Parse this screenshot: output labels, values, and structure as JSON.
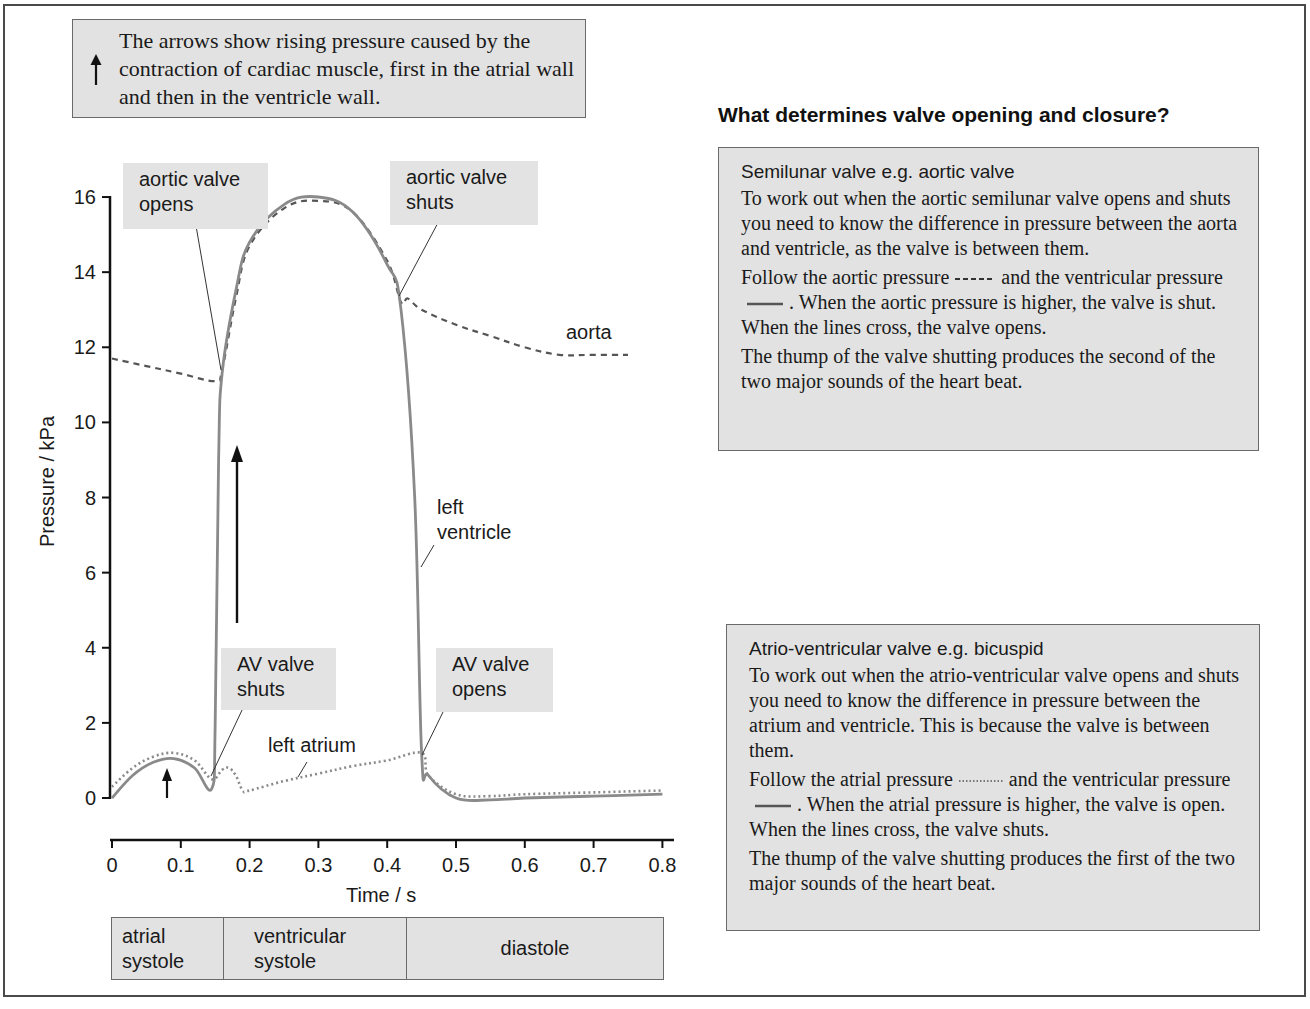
{
  "note": {
    "icon": "up-arrow-icon",
    "text": "The arrows show rising pressure caused by the contraction of cardiac muscle, first in the atrial wall and then in the ventricle wall."
  },
  "chart_data": {
    "type": "line",
    "title": "",
    "xlabel": "Time / s",
    "ylabel": "Pressure / kPa",
    "xlim": [
      0,
      0.8
    ],
    "ylim": [
      0,
      16
    ],
    "xticks": [
      "0",
      "0.1",
      "0.2",
      "0.3",
      "0.4",
      "0.5",
      "0.6",
      "0.7",
      "0.8"
    ],
    "yticks": [
      "0",
      "2",
      "4",
      "6",
      "8",
      "10",
      "12",
      "14",
      "16"
    ],
    "grid": false,
    "series": [
      {
        "name": "aorta",
        "style": "dashed",
        "color": "#555555",
        "x": [
          0.0,
          0.05,
          0.1,
          0.15,
          0.16,
          0.18,
          0.2,
          0.25,
          0.3,
          0.35,
          0.4,
          0.42,
          0.43,
          0.45,
          0.5,
          0.55,
          0.6,
          0.65,
          0.7,
          0.75
        ],
        "y": [
          11.7,
          11.5,
          11.3,
          11.1,
          11.4,
          13.3,
          14.7,
          15.7,
          15.9,
          15.6,
          14.3,
          13.2,
          13.3,
          13.0,
          12.6,
          12.3,
          12.0,
          11.8,
          11.8,
          11.8
        ]
      },
      {
        "name": "left ventricle",
        "style": "solid",
        "color": "#8a8a8a",
        "x": [
          0.0,
          0.03,
          0.06,
          0.09,
          0.12,
          0.145,
          0.15,
          0.155,
          0.16,
          0.18,
          0.2,
          0.25,
          0.3,
          0.35,
          0.4,
          0.42,
          0.44,
          0.45,
          0.46,
          0.5,
          0.55,
          0.6,
          0.7,
          0.8
        ],
        "y": [
          0.0,
          0.6,
          0.95,
          1.05,
          0.8,
          0.25,
          2.0,
          9.0,
          11.3,
          13.5,
          14.8,
          15.8,
          16.0,
          15.6,
          14.2,
          13.0,
          8.0,
          1.2,
          0.6,
          0.0,
          -0.05,
          0.0,
          0.05,
          0.1
        ]
      },
      {
        "name": "left atrium",
        "style": "dotted",
        "color": "#8a8a8a",
        "x": [
          0.0,
          0.03,
          0.06,
          0.09,
          0.12,
          0.145,
          0.16,
          0.17,
          0.18,
          0.19,
          0.2,
          0.25,
          0.3,
          0.35,
          0.4,
          0.45,
          0.46,
          0.5,
          0.55,
          0.6,
          0.7,
          0.8
        ],
        "y": [
          0.3,
          0.8,
          1.1,
          1.2,
          1.0,
          0.5,
          0.75,
          0.8,
          0.6,
          0.2,
          0.2,
          0.45,
          0.65,
          0.85,
          1.0,
          1.2,
          0.6,
          0.1,
          0.05,
          0.1,
          0.15,
          0.2
        ]
      }
    ],
    "annotations": [
      {
        "text": "aortic valve opens",
        "x": 0.155,
        "y": 11.2
      },
      {
        "text": "aortic valve shuts",
        "x": 0.42,
        "y": 13.2
      },
      {
        "text": "AV valve shuts",
        "x": 0.145,
        "y": 0.4
      },
      {
        "text": "AV valve opens",
        "x": 0.45,
        "y": 1.2
      },
      {
        "text": "aorta",
        "x": 0.66,
        "y": 12.4
      },
      {
        "text": "left ventricle",
        "x": 0.46,
        "y": 7.0
      },
      {
        "text": "left atrium",
        "x": 0.25,
        "y": 1.4
      }
    ],
    "arrows": [
      {
        "x": 0.08,
        "y_from": 0.0,
        "y_to": 0.8,
        "meaning": "atrial contraction"
      },
      {
        "x": 0.18,
        "y_from": 4.7,
        "y_to": 9.4,
        "meaning": "ventricular contraction"
      }
    ],
    "phases": [
      {
        "label": "atrial systole",
        "from": 0.0,
        "to": 0.16
      },
      {
        "label": "ventricular systole",
        "from": 0.16,
        "to": 0.43
      },
      {
        "label": "diastole",
        "from": 0.43,
        "to": 0.8
      }
    ]
  },
  "chart_labels": {
    "ylabel": "Pressure / kPa",
    "xlabel": "Time / s",
    "aortic_opens": "aortic valve opens",
    "aortic_opens_l1": "aortic valve",
    "aortic_opens_l2": "opens",
    "aortic_shuts_l1": "aortic valve",
    "aortic_shuts_l2": "shuts",
    "av_shuts_l1": "AV valve",
    "av_shuts_l2": "shuts",
    "av_opens_l1": "AV valve",
    "av_opens_l2": "opens",
    "aorta": "aorta",
    "ventricle_l1": "left",
    "ventricle_l2": "ventricle",
    "atrium": "left atrium"
  },
  "phases": {
    "p1_l1": "atrial",
    "p1_l2": "systole",
    "p2_l1": "ventricular",
    "p2_l2": "systole",
    "p3": "diastole"
  },
  "right_panel": {
    "heading": "What determines valve opening and closure?",
    "semilunar": {
      "title": "Semilunar valve e.g. aortic valve",
      "para1": "To work out when the aortic semilunar valve opens and shuts you need to know the difference in pressure between the aorta and ventricle, as the valve is between them.",
      "para2_a": "Follow the aortic pressure",
      "para2_b": "and the ventricular pressure",
      "para2_c": ". When the aortic pressure is higher, the valve is shut. When the lines cross, the valve opens.",
      "para3": "The thump of the valve shutting produces the second of the two major sounds of the heart beat."
    },
    "av": {
      "title": "Atrio-ventricular valve e.g. bicuspid",
      "para1": "To work out when the atrio-ventricular valve opens and shuts you need to know the difference in pressure between the atrium and ventricle. This is because the valve is between them.",
      "para2_a": "Follow the atrial pressure",
      "para2_b": "and the ventricular pressure",
      "para2_c": ". When the atrial pressure is higher, the valve is open. When the lines cross, the valve shuts.",
      "para3": "The thump of the valve shutting produces the first of the two major sounds of the heart beat."
    }
  }
}
